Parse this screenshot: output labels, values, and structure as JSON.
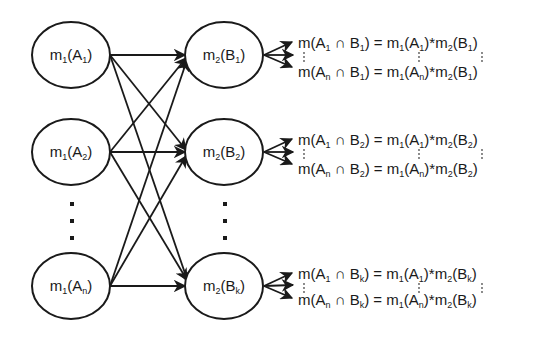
{
  "diagram": {
    "type": "bipartite-combination-graph",
    "left_nodes": [
      {
        "id": "A1",
        "func": "m",
        "func_sub": "1",
        "set": "A",
        "set_sub": "1"
      },
      {
        "id": "A2",
        "func": "m",
        "func_sub": "1",
        "set": "A",
        "set_sub": "2"
      },
      {
        "id": "An",
        "func": "m",
        "func_sub": "1",
        "set": "A",
        "set_sub": "n"
      }
    ],
    "right_nodes": [
      {
        "id": "B1",
        "func": "m",
        "func_sub": "2",
        "set": "B",
        "set_sub": "1"
      },
      {
        "id": "B2",
        "func": "m",
        "func_sub": "2",
        "set": "B",
        "set_sub": "2"
      },
      {
        "id": "Bk",
        "func": "m",
        "func_sub": "2",
        "set": "B",
        "set_sub": "k"
      }
    ],
    "ellipsis": "⋮",
    "edges": "every left node connects to every right node",
    "formula_groups": [
      {
        "target": "B1",
        "first": {
          "lhs_a_sub": "1",
          "b_sub": "1",
          "rhs_a_sub": "1"
        },
        "last": {
          "lhs_a_sub": "n",
          "b_sub": "1",
          "rhs_a_sub": "n"
        }
      },
      {
        "target": "B2",
        "first": {
          "lhs_a_sub": "1",
          "b_sub": "2",
          "rhs_a_sub": "1"
        },
        "last": {
          "lhs_a_sub": "n",
          "b_sub": "2",
          "rhs_a_sub": "n"
        }
      },
      {
        "target": "Bk",
        "first": {
          "lhs_a_sub": "1",
          "b_sub": "k",
          "rhs_a_sub": "1"
        },
        "last": {
          "lhs_a_sub": "n",
          "b_sub": "k",
          "rhs_a_sub": "n"
        }
      }
    ],
    "symbols": {
      "m": "m",
      "m1_sub": "1",
      "m2_sub": "2",
      "A": "A",
      "B": "B",
      "intersect": "∩",
      "equals": "=",
      "times": "*",
      "open_paren": "(",
      "close_paren": ")"
    }
  }
}
